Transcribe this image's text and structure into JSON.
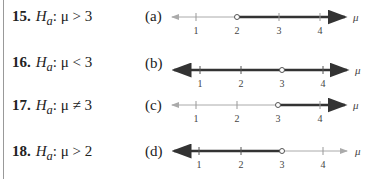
{
  "problems": [
    {
      "number": "15.",
      "var": "H",
      "sub": "a",
      "rest": ": μ > 3"
    },
    {
      "number": "16.",
      "var": "H",
      "sub": "a",
      "rest": ": μ < 3"
    },
    {
      "number": "17.",
      "var": "H",
      "sub": "a",
      "rest": ": μ ≠ 3"
    },
    {
      "number": "18.",
      "var": "H",
      "sub": "a",
      "rest": ": μ > 2"
    }
  ],
  "graphs": [
    {
      "label": "(a)",
      "ticks": [
        "1",
        "2",
        "3",
        "4"
      ],
      "axis": "μ",
      "shaded": "x > 2",
      "open_point": "2"
    },
    {
      "label": "(b)",
      "ticks": [
        "1",
        "2",
        "3",
        "4"
      ],
      "axis": "μ",
      "shaded": "x ≠ 3",
      "open_point": "3"
    },
    {
      "label": "(c)",
      "ticks": [
        "1",
        "2",
        "3",
        "4"
      ],
      "axis": "μ",
      "shaded": "x > 3",
      "open_point": "3"
    },
    {
      "label": "(d)",
      "ticks": [
        "1",
        "2",
        "3",
        "4"
      ],
      "axis": "μ",
      "shaded": "x < 3",
      "open_point": "3"
    }
  ],
  "colors": {
    "thin": "#aaaaaa",
    "thick": "#333333"
  }
}
